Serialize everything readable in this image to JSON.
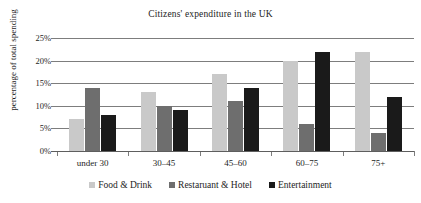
{
  "chart_data": {
    "type": "bar",
    "title": "Citizens' expenditure in the UK",
    "xlabel": "",
    "ylabel": "percentage of total spending",
    "ylim": [
      0,
      25
    ],
    "y_tick_labels": [
      "25%",
      "20%",
      "15%",
      "10%",
      "5%",
      "0%"
    ],
    "y_tick_values": [
      25,
      20,
      15,
      10,
      5,
      0
    ],
    "grid": true,
    "grid_axis": "y",
    "legend_position": "bottom",
    "categories": [
      "under 30",
      "30–45",
      "45–60",
      "60–75",
      "75+"
    ],
    "series": [
      {
        "name": "Food & Drink",
        "color": "#c9c9c9",
        "values": [
          7,
          13,
          17,
          20,
          22
        ]
      },
      {
        "name": "Restaruant & Hotel",
        "color": "#6e6e6e",
        "values": [
          14,
          10,
          11,
          6,
          4
        ]
      },
      {
        "name": "Entertainment",
        "color": "#1a1a1a",
        "values": [
          8,
          9,
          14,
          22,
          12
        ]
      }
    ]
  }
}
